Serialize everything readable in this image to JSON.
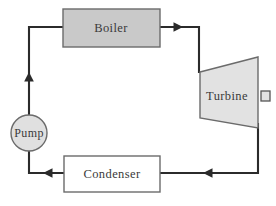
{
  "diagram": {
    "type": "process-flow-diagram",
    "flow_direction": "clockwise",
    "background_color": "#ffffff",
    "line_color": "#2b2b2b",
    "components": [
      {
        "id": "boiler",
        "label": "Boiler",
        "shape": "rectangle",
        "fill": "#c9c9c9",
        "stroke": "#6b6b6b",
        "x": 63,
        "y": 9,
        "width": 97,
        "height": 38,
        "label_x": 111,
        "label_y": 28
      },
      {
        "id": "turbine",
        "label": "Turbine",
        "shape": "trapezoid",
        "fill": "#e2e2e2",
        "stroke": "#6b6b6b",
        "points": "200,72 258,57 258,128 200,118",
        "label_x": 227,
        "label_y": 96
      },
      {
        "id": "condenser",
        "label": "Condenser",
        "shape": "rectangle",
        "fill": "#ffffff",
        "stroke": "#6b6b6b",
        "x": 64,
        "y": 156,
        "width": 96,
        "height": 36,
        "label_x": 112,
        "label_y": 174
      },
      {
        "id": "pump",
        "label": "Pump",
        "shape": "circle",
        "fill": "#e0e0e0",
        "stroke": "#6b6b6b",
        "cx": 29,
        "cy": 133,
        "r": 18,
        "label_x": 29,
        "label_y": 133
      },
      {
        "id": "turbine-shaft",
        "label": "",
        "shape": "rectangle",
        "fill": "#e2e2e2",
        "stroke": "#6b6b6b",
        "x": 261,
        "y": 91,
        "width": 9,
        "height": 10
      }
    ],
    "pipes": [
      {
        "id": "pump-to-boiler",
        "from": "pump",
        "to": "boiler",
        "path": "M 29 115 L 29 27 L 63 27",
        "arrow": {
          "x": 29,
          "y": 78,
          "direction": "up"
        }
      },
      {
        "id": "boiler-to-turbine",
        "from": "boiler",
        "to": "turbine",
        "path": "M 160 27 L 199 27 L 199 73",
        "arrow": {
          "x": 178,
          "y": 27,
          "direction": "right"
        }
      },
      {
        "id": "turbine-to-condenser",
        "from": "turbine",
        "to": "condenser",
        "path": "M 258 123 L 258 173 L 160 173",
        "arrow": {
          "x": 208,
          "y": 173,
          "direction": "left"
        }
      },
      {
        "id": "condenser-to-pump",
        "from": "condenser",
        "to": "pump",
        "path": "M 64 173 L 29 173 L 29 151",
        "arrow": {
          "x": 48,
          "y": 173,
          "direction": "left"
        }
      }
    ]
  }
}
